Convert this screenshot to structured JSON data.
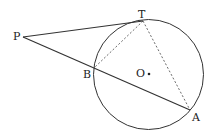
{
  "diagram": {
    "type": "geometry",
    "points": {
      "P": "P",
      "T": "T",
      "B": "B",
      "A": "A",
      "O": "O"
    },
    "segments": [
      {
        "from": "P",
        "to": "T",
        "style": "solid"
      },
      {
        "from": "P",
        "to": "A",
        "style": "solid"
      },
      {
        "from": "T",
        "to": "B",
        "style": "dashed"
      },
      {
        "from": "T",
        "to": "A",
        "style": "dashed"
      }
    ],
    "circle": {
      "center": "O"
    }
  }
}
